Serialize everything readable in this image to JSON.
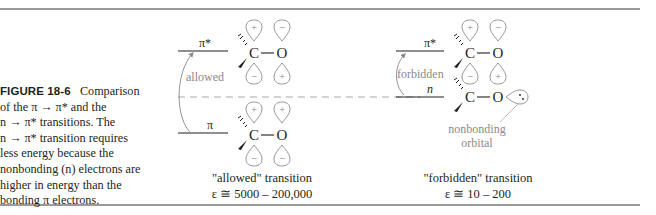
{
  "figure": {
    "number_label": "FIGURE 18-6",
    "caption_lines": [
      {
        "text": "Comparison"
      },
      {
        "text": "of the π → π* and the"
      },
      {
        "text": "n → π* transitions. The"
      },
      {
        "text": "n → π* transition requires"
      },
      {
        "text": "less energy because the"
      },
      {
        "text": "nonbonding (n) electrons are"
      },
      {
        "text": "higher in energy than the"
      },
      {
        "text": "bonding π electrons."
      }
    ]
  },
  "left_panel": {
    "upper_level_label": "π*",
    "lower_level_label": "π",
    "arrow_label": "allowed",
    "upper_orbital": {
      "atom_c": "C",
      "atom_o": "O",
      "c_top": "+",
      "c_bottom": "−",
      "o_top": "−",
      "o_bottom": "+"
    },
    "lower_orbital": {
      "atom_c": "C",
      "atom_o": "O",
      "c_top": "+",
      "c_bottom": "−",
      "o_top": "+",
      "o_bottom": "−"
    },
    "transition_title": "\"allowed\" transition",
    "epsilon": "ε ≅ 5000 – 200,000"
  },
  "right_panel": {
    "upper_level_label": "π*",
    "lower_level_label": "n",
    "arrow_label": "forbidden",
    "upper_orbital": {
      "atom_c": "C",
      "atom_o": "O",
      "c_top": "+",
      "c_bottom": "−",
      "o_top": "−",
      "o_bottom": "+"
    },
    "lower_orbital": {
      "atom_c": "C",
      "atom_o": "O"
    },
    "nonbonding_label_1": "nonbonding",
    "nonbonding_label_2": "orbital",
    "transition_title": "\"forbidden\" transition",
    "epsilon": "ε ≅ 10 – 200"
  },
  "colors": {
    "rule": "#9a9a9a",
    "text": "#231f20",
    "annotation_gray": "#8a8a8a",
    "dashed_line": "#a8a8a8"
  }
}
